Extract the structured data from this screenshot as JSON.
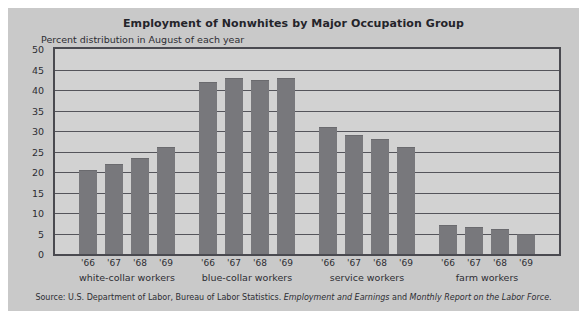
{
  "title": "Employment of Nonwhites by Major Occupation Group",
  "subtitle": "Percent distribution in August of each year",
  "source": {
    "prefix": "Source: U.S. Department of Labor, Bureau of Labor Statistics. ",
    "publication_1": "Employment and Earnings",
    "middle": " and ",
    "publication_2": "Monthly Report on the Labor Force",
    "suffix": "."
  },
  "colors": {
    "figure_background": "#c9c9c9",
    "plot_background": "#d2d2d2",
    "bar_fill": "#78787c",
    "gridline": "#55555b",
    "plot_border": "#4a4a50",
    "text": "#2d2d33"
  },
  "chart_data": {
    "type": "bar",
    "title": "Employment of Nonwhites by Major Occupation Group",
    "subtitle": "Percent distribution in August of each year",
    "xlabel": "",
    "ylabel": "",
    "ylim": [
      0,
      50
    ],
    "yticks": [
      0,
      5,
      10,
      15,
      20,
      25,
      30,
      35,
      40,
      45,
      50
    ],
    "ytick_labels": [
      "0",
      "5",
      "10",
      "15",
      "20",
      "25",
      "30",
      "35",
      "40",
      "45",
      "50"
    ],
    "grid": true,
    "legend": "none",
    "x": [
      "'66",
      "'67",
      "'68",
      "'69"
    ],
    "groups": [
      {
        "label": "white-collar workers",
        "categories": [
          "'66",
          "'67",
          "'68",
          "'69"
        ],
        "values": [
          20.5,
          22,
          23.5,
          26
        ]
      },
      {
        "label": "blue-collar workers",
        "categories": [
          "'66",
          "'67",
          "'68",
          "'69"
        ],
        "values": [
          42,
          43,
          42.5,
          43
        ]
      },
      {
        "label": "service workers",
        "categories": [
          "'66",
          "'67",
          "'68",
          "'69"
        ],
        "values": [
          31,
          29,
          28,
          26
        ]
      },
      {
        "label": "farm workers",
        "categories": [
          "'66",
          "'67",
          "'68",
          "'69"
        ],
        "values": [
          7,
          6.5,
          6,
          5
        ]
      }
    ]
  }
}
